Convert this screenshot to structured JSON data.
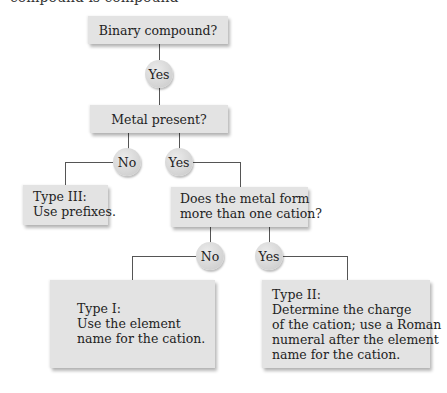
{
  "top_cropped_text": "compound is compound",
  "nodes": {
    "q_binary": "Binary compound?",
    "q_metal": "Metal present?",
    "q_cation": [
      "Does the metal form",
      "more than one cation?"
    ],
    "type3": [
      "Type III:",
      "Use prefixes."
    ],
    "type1": [
      "Type I:",
      "Use the element",
      "name for the cation."
    ],
    "type2": [
      "Type II:",
      "Determine the charge",
      "of the cation; use a Roman",
      "numeral after the element",
      "name for the cation."
    ]
  },
  "answers": {
    "binary_yes": "Yes",
    "metal_no": "No",
    "metal_yes": "Yes",
    "cation_no": "No",
    "cation_yes": "Yes"
  },
  "colors": {
    "box_fill": "#e3e3e3",
    "circle_fill": "#d6d6d6",
    "line": "#555555"
  }
}
